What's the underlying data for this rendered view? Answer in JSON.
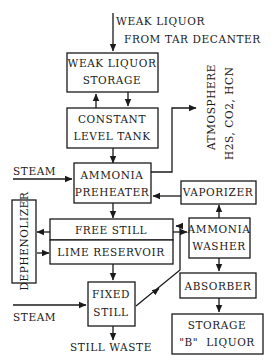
{
  "diagram": {
    "type": "process-flow",
    "inputs": {
      "weak_liquor_line1": "WEAK LIQUOR",
      "weak_liquor_line2": "FROM TAR DECANTER",
      "steam_top": "STEAM",
      "steam_bottom": "STEAM"
    },
    "outputs": {
      "atmosphere_line1": "ATMOSPHERE",
      "atmosphere_line2": "H2S, CO2, HCN",
      "still_waste": "STILL WASTE"
    },
    "nodes": {
      "weak_liquor_storage": {
        "line1": "WEAK LIQUOR",
        "line2": "STORAGE"
      },
      "constant_level_tank": {
        "line1": "CONSTANT",
        "line2": "LEVEL TANK"
      },
      "ammonia_preheater": {
        "line1": "AMMONIA",
        "line2": "PREHEATER"
      },
      "vaporizer": {
        "line1": "VAPORIZER"
      },
      "free_still": {
        "line1": "FREE STILL"
      },
      "lime_reservoir": {
        "line1": "LIME RESERVOIR"
      },
      "dephenolizer": {
        "line1": "DEPHENOLIZER"
      },
      "ammonia_washer": {
        "line1": "AMMONIA",
        "line2": "WASHER"
      },
      "fixed_still": {
        "line1": "FIXED",
        "line2": "STILL"
      },
      "absorber": {
        "line1": "ABSORBER"
      },
      "storage_b_liquor": {
        "line1": "STORAGE",
        "line2": "\"B\"  LIQUOR"
      }
    },
    "edges": [
      [
        "weak_liquor_input",
        "weak_liquor_storage"
      ],
      [
        "weak_liquor_storage",
        "constant_level_tank"
      ],
      [
        "constant_level_tank",
        "weak_liquor_storage"
      ],
      [
        "constant_level_tank",
        "ammonia_preheater"
      ],
      [
        "ammonia_preheater",
        "atmosphere"
      ],
      [
        "steam_top",
        "ammonia_preheater"
      ],
      [
        "vaporizer",
        "ammonia_preheater"
      ],
      [
        "ammonia_preheater",
        "free_still"
      ],
      [
        "free_still",
        "dephenolizer"
      ],
      [
        "dephenolizer",
        "lime_reservoir"
      ],
      [
        "free_still",
        "ammonia_washer"
      ],
      [
        "ammonia_washer",
        "vaporizer"
      ],
      [
        "lime_reservoir",
        "fixed_still"
      ],
      [
        "steam_bottom",
        "fixed_still"
      ],
      [
        "fixed_still",
        "free_still"
      ],
      [
        "fixed_still",
        "still_waste"
      ],
      [
        "ammonia_washer",
        "absorber"
      ],
      [
        "absorber",
        "storage_b_liquor"
      ]
    ]
  }
}
